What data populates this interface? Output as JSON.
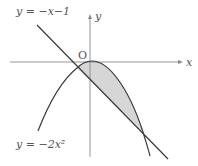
{
  "figure": {
    "type": "function-graph",
    "labels": {
      "line": "y = −x−1",
      "parabola": "y = −2x²",
      "origin": "O",
      "x_axis": "x",
      "y_axis": "y"
    },
    "curves": [
      {
        "name": "line",
        "equation": "y = -x - 1"
      },
      {
        "name": "parabola",
        "equation": "y = -2x^2"
      }
    ],
    "shaded_region": "area between y = -2x^2 and y = -x - 1",
    "intersections": [
      {
        "x": -0.5,
        "y": -0.5
      },
      {
        "x": 1,
        "y": -2
      }
    ],
    "colors": {
      "stroke": "#3a3a3a",
      "axis": "#8a8a8a",
      "fill": "#d6d6d6",
      "text": "#555555"
    }
  }
}
